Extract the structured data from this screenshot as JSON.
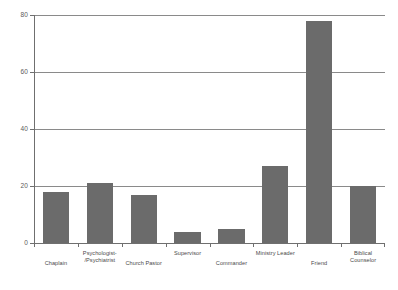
{
  "chart_data": {
    "type": "bar",
    "title": "",
    "subtitle": "",
    "xlabel": "",
    "ylabel": "",
    "categories": [
      "Chaplain",
      "Psychologist/Psychiatrist",
      "Church Pastor",
      "Supervisor",
      "Commander",
      "Ministry Leader",
      "Friend",
      "Biblical Counselor"
    ],
    "category_display": [
      "Chaplain",
      "Psychologist-\n/Psychiatrist",
      "Church Pastor",
      "Supervisor",
      "Commander",
      "Ministry Leader",
      "Friend",
      "Biblical Counselor"
    ],
    "values": [
      18,
      21,
      17,
      4,
      5,
      27,
      78,
      20
    ],
    "ylim": [
      0,
      80
    ],
    "yticks": [
      0,
      20,
      40,
      60,
      80
    ],
    "ytick_labels": [
      "0",
      "20",
      "40",
      "60",
      "80"
    ],
    "grid": "horizontal",
    "legend": "none",
    "bar_color": "#6b6b6b",
    "axis_color": "#6f6f6f",
    "grid_color": "#8a8a8a",
    "background": "#ffffff"
  }
}
